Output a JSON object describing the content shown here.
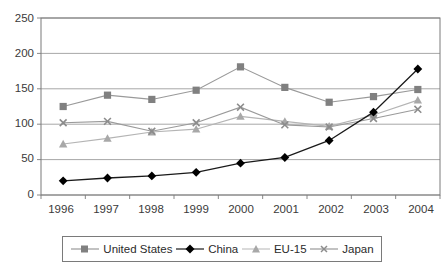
{
  "chart_data": {
    "type": "line",
    "title": "",
    "xlabel": "",
    "ylabel": "",
    "categories": [
      "1996",
      "1997",
      "1998",
      "1999",
      "2000",
      "2001",
      "2002",
      "2003",
      "2004"
    ],
    "x": [
      1996,
      1997,
      1998,
      1999,
      2000,
      2001,
      2002,
      2003,
      2004
    ],
    "ylim": [
      0,
      250
    ],
    "yticks": [
      0,
      50,
      100,
      150,
      200,
      250
    ],
    "ytick_labels": [
      "0",
      "50",
      "100",
      "150",
      "200",
      "250"
    ],
    "grid": "horizontal",
    "legend_position": "bottom",
    "series": [
      {
        "name": "United States",
        "marker": "square",
        "color": "#808080",
        "line_color": "#9a9a9a",
        "values": [
          125,
          141,
          135,
          148,
          181,
          152,
          131,
          139,
          149
        ]
      },
      {
        "name": "China",
        "marker": "diamond",
        "color": "#000000",
        "line_color": "#1a1a1a",
        "values": [
          20,
          24,
          27,
          32,
          45,
          53,
          77,
          117,
          178
        ]
      },
      {
        "name": "EU-15",
        "marker": "triangle",
        "color": "#a8a8a8",
        "line_color": "#b4b4b4",
        "values": [
          72,
          80,
          89,
          93,
          111,
          104,
          97,
          113,
          134
        ]
      },
      {
        "name": "Japan",
        "marker": "x",
        "color": "#8c8c8c",
        "line_color": "#9a9a9a",
        "values": [
          102,
          104,
          90,
          102,
          124,
          99,
          96,
          108,
          121
        ]
      }
    ]
  },
  "axis": {
    "y_labels": [
      "250",
      "200",
      "150",
      "100",
      "50",
      "0"
    ],
    "x_labels": [
      "1996",
      "1997",
      "1998",
      "1999",
      "2000",
      "2001",
      "2002",
      "2003",
      "2004"
    ]
  },
  "legend": {
    "entries": [
      {
        "label": "United States"
      },
      {
        "label": "China"
      },
      {
        "label": "EU-15"
      },
      {
        "label": "Japan"
      }
    ]
  },
  "colors": {
    "united_states": "#808080",
    "china": "#000000",
    "eu15": "#a8a8a8",
    "japan": "#8c8c8c",
    "axis": "#7a7a7a",
    "grid": "#9d9d9d",
    "text": "#3a3a3a"
  }
}
